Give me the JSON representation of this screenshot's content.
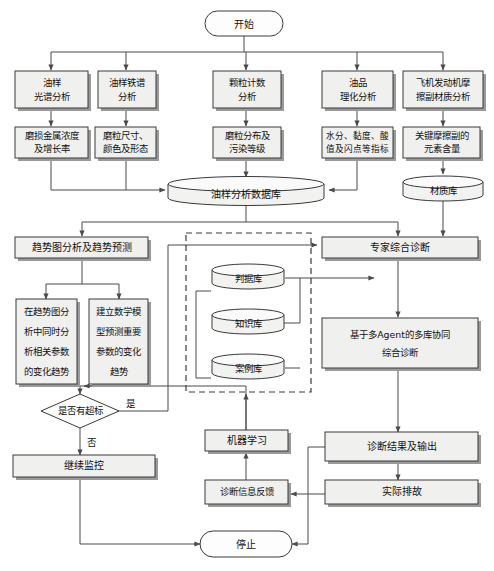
{
  "diagram": {
    "type": "flowchart",
    "orientation": "top-down",
    "colors": {
      "box_fill": "#f0f0ef",
      "box_stroke": "#3a3a3a",
      "shadow": "#9a9a9a",
      "line": "#4a4a4a",
      "background": "#ffffff"
    }
  },
  "nodes": {
    "start": {
      "label": "开始",
      "shape": "terminator"
    },
    "row1": [
      {
        "label": "油样\n光谱分析",
        "lines": [
          "油样",
          "光谱分析"
        ],
        "shape": "process"
      },
      {
        "label": "油样铁谱\n分析",
        "lines": [
          "油样铁谱",
          "分析"
        ],
        "shape": "process"
      },
      {
        "label": "颗粒计数\n分析",
        "lines": [
          "颗粒计数",
          "分析"
        ],
        "shape": "process"
      },
      {
        "label": "油品\n理化分析",
        "lines": [
          "油品",
          "理化分析"
        ],
        "shape": "process"
      },
      {
        "label": "飞机发动机摩\n擦副材质分析",
        "lines": [
          "飞机发动机摩",
          "擦副材质分析"
        ],
        "shape": "process"
      }
    ],
    "row2": [
      {
        "label": "磨损金属浓度\n及增长率",
        "lines": [
          "磨损金属浓度",
          "及增长率"
        ],
        "shape": "process"
      },
      {
        "label": "磨粒尺寸、\n颜色及形态",
        "lines": [
          "磨粒尺寸、",
          "颜色及形态"
        ],
        "shape": "process"
      },
      {
        "label": "磨粒分布及\n污染等级",
        "lines": [
          "磨粒分布及",
          "污染等级"
        ],
        "shape": "process"
      },
      {
        "label": "水分、黏度、酸\n值及闪点等指标",
        "lines": [
          "水分、黏度、酸",
          "值及闪点等指标"
        ],
        "shape": "process"
      },
      {
        "label": "关键摩擦副的\n元素含量",
        "lines": [
          "关键摩擦副的",
          "元素含量"
        ],
        "shape": "process"
      }
    ],
    "oil_database": {
      "label": "油样分析数据库",
      "shape": "database"
    },
    "material_database": {
      "label": "材质库",
      "shape": "database"
    },
    "trend_analysis": {
      "label": "趋势图分析及趋势预测",
      "shape": "process"
    },
    "trend_sub_left": {
      "lines": [
        "在趋势图分",
        "析中同时分",
        "析相关参数",
        "的变化趋势"
      ],
      "label": "在趋势图分析中同时分析相关参数的变化趋势",
      "shape": "process"
    },
    "trend_sub_right": {
      "lines": [
        "建立数学模",
        "型预测重要",
        "参数的变化",
        "趋势"
      ],
      "label": "建立数学模型预测重要参数的变化趋势",
      "shape": "process"
    },
    "knowledge_bases": [
      {
        "label": "判据库",
        "shape": "database"
      },
      {
        "label": "知识库",
        "shape": "database"
      },
      {
        "label": "案例库",
        "shape": "database"
      }
    ],
    "expert_diagnosis": {
      "label": "专家综合诊断",
      "shape": "process"
    },
    "multi_agent": {
      "lines": [
        "基于多Agent的多库协同",
        "综合诊断"
      ],
      "label": "基于多Agent的多库协同综合诊断",
      "shape": "process"
    },
    "decision": {
      "label": "是否有超标",
      "shape": "decision"
    },
    "continue_monitor": {
      "label": "继续监控",
      "shape": "process"
    },
    "machine_learning": {
      "label": "机器学习",
      "shape": "process"
    },
    "diagnosis_feedback": {
      "label": "诊断信息反馈",
      "shape": "process"
    },
    "diagnosis_output": {
      "label": "诊断结果及输出",
      "shape": "process"
    },
    "actual_troubleshoot": {
      "label": "实际排故",
      "shape": "process"
    },
    "stop": {
      "label": "停止",
      "shape": "terminator"
    }
  },
  "edge_labels": {
    "yes": "是",
    "no": "否"
  }
}
